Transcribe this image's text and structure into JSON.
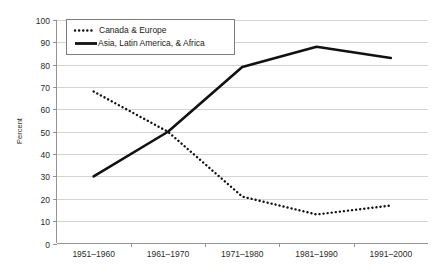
{
  "chart_data": {
    "type": "line",
    "title": "",
    "xlabel": "",
    "ylabel": "Percent",
    "ylim": [
      0,
      100
    ],
    "ytick_step": 10,
    "grid": true,
    "legend_position": "upper-left-inside",
    "categories": [
      "1951–1960",
      "1961–1970",
      "1971–1980",
      "1981–1990",
      "1991–2000"
    ],
    "yticks": [
      "0",
      "10",
      "20",
      "30",
      "40",
      "50",
      "60",
      "70",
      "80",
      "90",
      "100"
    ],
    "series": [
      {
        "name": "Canada & Europe",
        "style": "dotted",
        "color": "#111111",
        "values": [
          68,
          50,
          21,
          13,
          17
        ]
      },
      {
        "name": "Asia, Latin America, & Africa",
        "style": "solid",
        "color": "#111111",
        "values": [
          30,
          50,
          79,
          88,
          83
        ]
      }
    ]
  },
  "legend": {
    "entries": [
      {
        "label": "Canada & Europe"
      },
      {
        "label": "Asia, Latin America, & Africa"
      }
    ]
  },
  "colors": {
    "series": "#111111",
    "gridline": "#c9c9c9",
    "axis": "#8a8a8a",
    "legend_border": "#7d7d7d",
    "background": "#ffffff"
  }
}
